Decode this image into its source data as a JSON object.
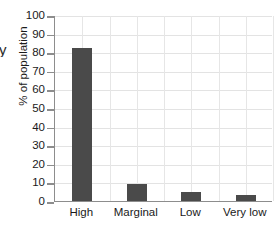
{
  "chart_data": {
    "type": "bar",
    "title": "",
    "xlabel": "",
    "ylabel": "% of population",
    "categories": [
      "High",
      "Marginal",
      "Low",
      "Very low"
    ],
    "values": [
      82,
      9,
      5,
      3.5
    ],
    "ylim": [
      0,
      100
    ],
    "ytick_step": 10,
    "yticks": [
      0,
      10,
      20,
      30,
      40,
      50,
      60,
      70,
      80,
      90,
      100
    ],
    "ytick_labels": [
      "0",
      "10",
      "20",
      "30",
      "40",
      "50",
      "60",
      "70",
      "80",
      "90",
      "100"
    ],
    "grid": true,
    "legend": false,
    "series": [
      {
        "name": "% of population",
        "values": [
          82,
          9,
          5,
          3.5
        ]
      }
    ],
    "colors": {
      "bar": "#4a4a4a",
      "axis": "#8d8d8d",
      "grid": "#e3e3e3",
      "background": "#ffffff",
      "text": "#1a1a1a"
    }
  },
  "edge_fragment": "y"
}
